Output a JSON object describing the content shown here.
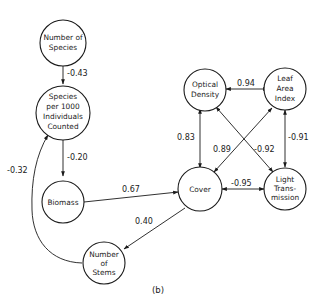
{
  "diagram": {
    "caption": "(b)",
    "nodes": {
      "number_of_species": {
        "lines": [
          "Number of",
          "Species"
        ]
      },
      "species_per_1000": {
        "lines": [
          "Species",
          "per 1000",
          "Individuals",
          "Counted"
        ]
      },
      "biomass": {
        "lines": [
          "Biomass"
        ]
      },
      "cover": {
        "lines": [
          "Cover"
        ]
      },
      "number_of_stems": {
        "lines": [
          "Number",
          "of",
          "Stems"
        ]
      },
      "optical_density": {
        "lines": [
          "Optical",
          "Density"
        ]
      },
      "leaf_area_index": {
        "lines": [
          "Leaf",
          "Area",
          "Index"
        ]
      },
      "light_transmission": {
        "lines": [
          "Light",
          "Trans-",
          "mission"
        ]
      }
    },
    "edges": {
      "species_to_species1000": {
        "from": "Number of Species",
        "to": "Species per 1000 Individuals Counted",
        "label": "-0.43"
      },
      "species1000_to_biomass": {
        "from": "Species per 1000 Individuals Counted",
        "to": "Biomass",
        "label": "-0.20"
      },
      "stems_to_species1000": {
        "from": "Number of Stems",
        "to": "Species per 1000 Individuals Counted",
        "label": "-0.32"
      },
      "biomass_to_cover": {
        "from": "Biomass",
        "to": "Cover",
        "label": "0.67"
      },
      "cover_to_stems": {
        "from": "Cover",
        "to": "Number of Stems",
        "label": "0.40"
      },
      "optical_leaf": {
        "from": "Optical Density",
        "to": "Leaf Area Index",
        "label": "0.94"
      },
      "optical_cover": {
        "from": "Optical Density",
        "to": "Cover",
        "label": "0.83"
      },
      "leaf_cover": {
        "from": "Leaf Area Index",
        "to": "Cover",
        "label": "0.89"
      },
      "optical_light": {
        "from": "Optical Density",
        "to": "Light Transmission",
        "label": "-0.92"
      },
      "leaf_light": {
        "from": "Leaf Area Index",
        "to": "Light Transmission",
        "label": "-0.91"
      },
      "cover_light": {
        "from": "Cover",
        "to": "Light Transmission",
        "label": "-0.95"
      }
    }
  }
}
